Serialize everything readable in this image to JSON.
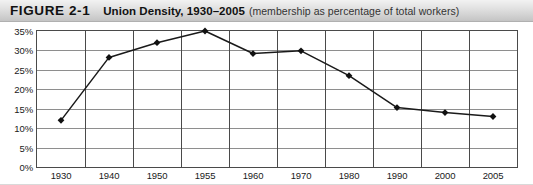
{
  "figure": {
    "number": "FIGURE 2-1",
    "title": "Union Density, 1930–2005",
    "subtitle": "(membership as percentage of total workers)"
  },
  "chart_data": {
    "type": "line",
    "title": "Union Density, 1930–2005",
    "subtitle": "(membership as percentage of total workers)",
    "xlabel": "",
    "ylabel": "",
    "categories": [
      "1930",
      "1940",
      "1950",
      "1955",
      "1960",
      "1970",
      "1980",
      "1990",
      "2000",
      "2005"
    ],
    "values": [
      12.0,
      28.2,
      32.0,
      35.0,
      29.2,
      29.9,
      23.5,
      15.3,
      14.0,
      13.0
    ],
    "ylim": [
      0,
      35
    ],
    "ytick_values": [
      0,
      5,
      10,
      15,
      20,
      25,
      30,
      35
    ],
    "ytick_labels": [
      "0%",
      "5%",
      "10%",
      "15%",
      "20%",
      "25%",
      "30%",
      "35%"
    ],
    "grid": "both",
    "legend": "none",
    "marker": "diamond",
    "line_color": "#1a1a1a",
    "marker_color": "#111111"
  },
  "colors": {
    "header_gradient_top": "#f2f2f2",
    "header_gradient_bottom": "#c4c4c4",
    "axis": "#4a4a4a",
    "gridline": "#8e8e8e",
    "text": "#1a1a1a",
    "series": "#1a1a1a"
  }
}
